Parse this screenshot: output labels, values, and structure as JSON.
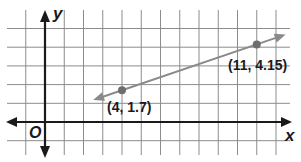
{
  "chart_data": {
    "type": "line",
    "title": "",
    "xlabel": "x",
    "ylabel": "y",
    "origin_label": "O",
    "grid": true,
    "xlim": [
      -1,
      12.5
    ],
    "ylim": [
      -1,
      5
    ],
    "grid_step": 1,
    "line": {
      "description": "line through two labeled points, arrows at both ends",
      "slope": 0.35,
      "intercept": 0.3,
      "x_range": [
        2.5,
        12.5
      ]
    },
    "points": [
      {
        "x": 4,
        "y": 1.7,
        "label": "(4, 1.7)"
      },
      {
        "x": 11,
        "y": 4.15,
        "label": "(11, 4.15)"
      }
    ]
  },
  "labels": {
    "x_axis": "x",
    "y_axis": "y",
    "origin": "O",
    "point1": "(4, 1.7)",
    "point2": "(11, 4.15)"
  },
  "colors": {
    "grid": "#8c8c8c",
    "axis": "#1a1a1a",
    "line": "#8a8a8a",
    "point": "#6e6e6e"
  }
}
